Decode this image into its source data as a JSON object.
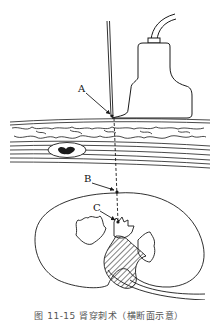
{
  "figure": {
    "labels": {
      "a": "A",
      "b": "B",
      "c": "C"
    },
    "parts": [
      "ultrasound-probe",
      "puncture-needle",
      "skin-and-subcutaneous-tissue",
      "muscle-layer",
      "blood-vessel",
      "kidney",
      "renal-pelvis"
    ],
    "colors": {
      "line": "#1a1a1a",
      "background": "#ffffff",
      "caption": "#555555"
    }
  },
  "caption": "图 11-15 肾穿刺术（横断面示意）"
}
